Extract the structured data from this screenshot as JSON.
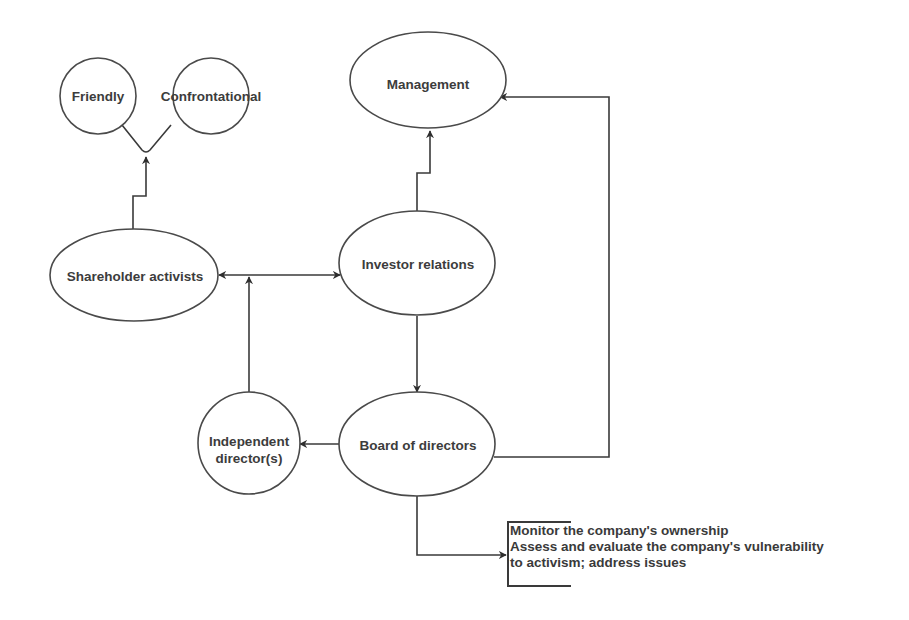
{
  "diagram": {
    "type": "flowchart",
    "nodes": {
      "friendly": "Friendly",
      "confrontational": "Confrontational",
      "management": "Management",
      "shareholder_activists": "Shareholder activists",
      "investor_relations": "Investor relations",
      "independent_directors": [
        "Independent",
        "director(s)"
      ],
      "board_of_directors": "Board of directors"
    },
    "note": {
      "lines": [
        "Monitor the company's ownership",
        "Assess and evaluate the company's vulnerability",
        "to activism; address issues"
      ]
    },
    "edges": [
      {
        "from": "Shareholder activists",
        "to": "Friendly / Confrontational",
        "style": "arrow"
      },
      {
        "from": "Investor relations",
        "to": "Management",
        "style": "arrow"
      },
      {
        "from": "Shareholder activists",
        "to": "Investor relations",
        "style": "bidirectional"
      },
      {
        "from": "Independent director(s)",
        "to": "Shareholder activists / Investor relations link",
        "style": "arrow"
      },
      {
        "from": "Investor relations",
        "to": "Board of directors",
        "style": "arrow"
      },
      {
        "from": "Board of directors",
        "to": "Independent director(s)",
        "style": "arrow"
      },
      {
        "from": "Board of directors",
        "to": "Management",
        "style": "arrow"
      },
      {
        "from": "Board of directors",
        "to": "Note",
        "style": "arrow"
      }
    ],
    "colors": {
      "stroke": "#4a4a4a",
      "text": "#3c3c3c",
      "background": "#ffffff"
    }
  }
}
